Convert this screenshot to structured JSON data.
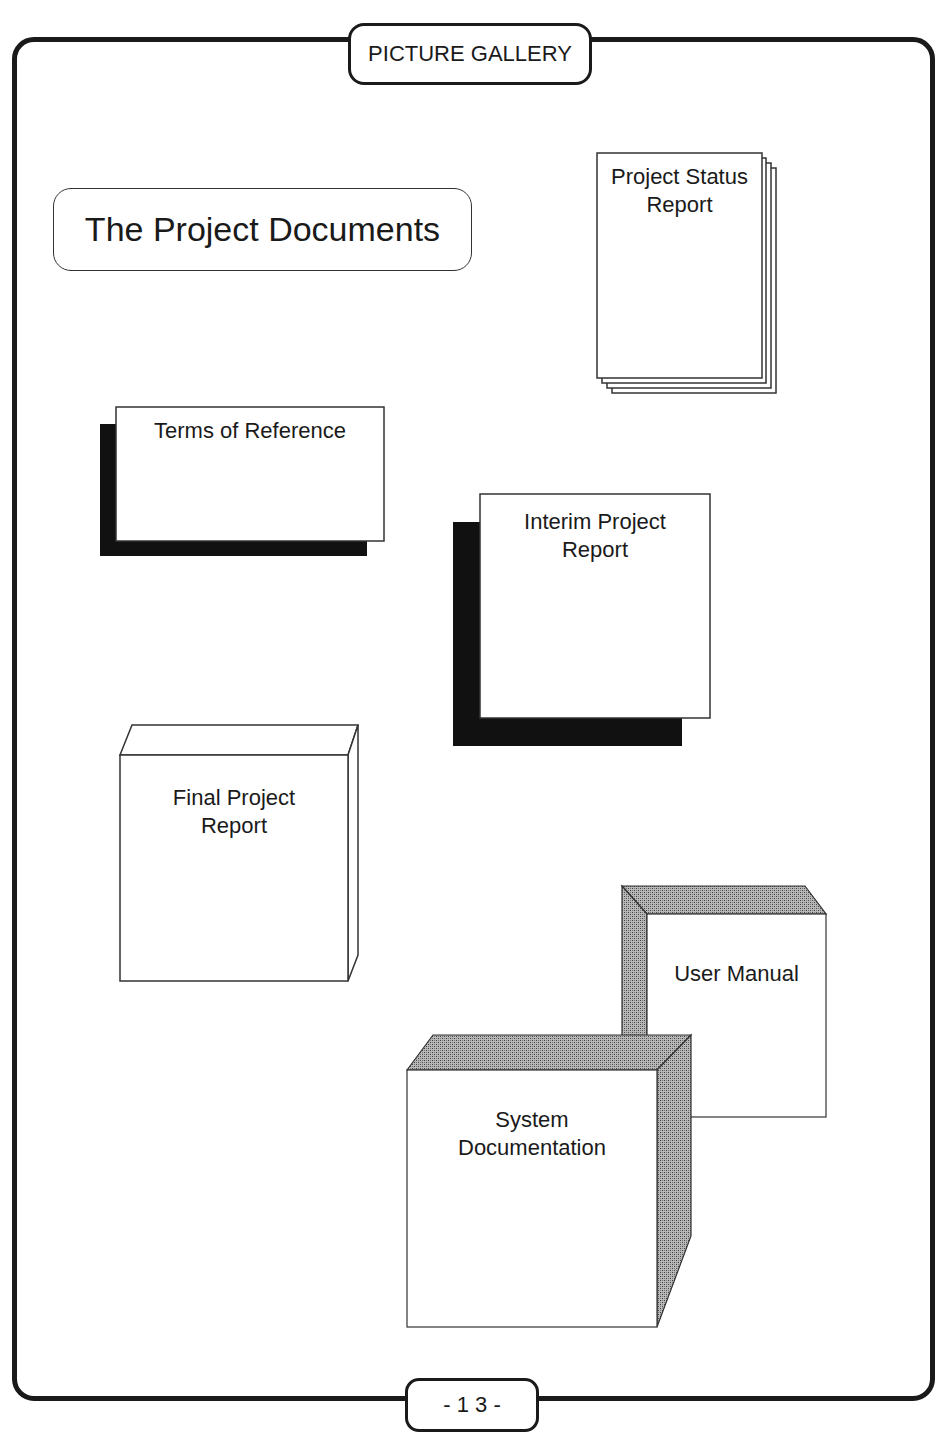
{
  "page": {
    "header": "PICTURE GALLERY",
    "title": "The Project Documents",
    "page_number": "- 1 3 -"
  },
  "documents": [
    {
      "id": "project-status-report",
      "lines": [
        "Project Status",
        "Report"
      ],
      "style": "stacked-pages"
    },
    {
      "id": "terms-of-reference",
      "lines": [
        "Terms of Reference"
      ],
      "style": "drop-shadow"
    },
    {
      "id": "interim-project-report",
      "lines": [
        "Interim Project",
        "Report"
      ],
      "style": "drop-shadow"
    },
    {
      "id": "final-project-report",
      "lines": [
        "Final Project",
        "Report"
      ],
      "style": "3d-box-outline"
    },
    {
      "id": "user-manual",
      "lines": [
        "User Manual"
      ],
      "style": "3d-box-shaded"
    },
    {
      "id": "system-documentation",
      "lines": [
        "System",
        "Documentation"
      ],
      "style": "3d-box-shaded"
    }
  ],
  "colors": {
    "ink": "#1a1a1a",
    "shadow": "#111111",
    "shade": "#8a8a8a",
    "paper": "#ffffff"
  }
}
